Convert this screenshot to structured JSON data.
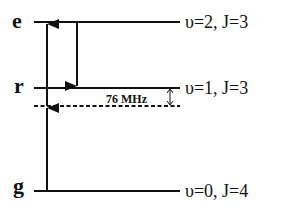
{
  "levels": {
    "e": {
      "letter": "e",
      "label": "υ=2, J=3"
    },
    "r": {
      "letter": "r",
      "label": "υ=1, J=3"
    },
    "g": {
      "letter": "g",
      "label": "υ=0, J=4"
    }
  },
  "detuning": {
    "label": "76 MHz"
  },
  "colors": {
    "line": "#111111",
    "background": "#ffffff"
  }
}
